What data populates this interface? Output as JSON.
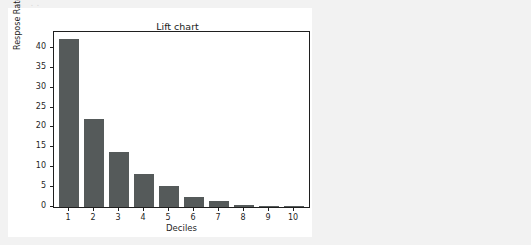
{
  "page": {
    "background_color": "#f2f2f2",
    "top_artifact_text": "..  .."
  },
  "card": {
    "background_color": "#ffffff"
  },
  "chart_data": {
    "type": "bar",
    "title": "Lift chart",
    "xlabel": "Deciles",
    "ylabel": "Respose Rate(%)",
    "categories": [
      "1",
      "2",
      "3",
      "4",
      "5",
      "6",
      "7",
      "8",
      "9",
      "10"
    ],
    "values": [
      42.2,
      22.1,
      13.8,
      8.4,
      5.2,
      2.5,
      1.5,
      0.6,
      0.2,
      0.1
    ],
    "ylim": [
      0,
      44
    ],
    "xlim": [
      0.4,
      10.6
    ],
    "yticks": [
      0,
      5,
      10,
      15,
      20,
      25,
      30,
      35,
      40
    ],
    "ytick_labels": [
      "0",
      "5",
      "10",
      "15",
      "20",
      "25",
      "30",
      "35",
      "40"
    ],
    "grid": false,
    "legend": null,
    "bar_color": "#555a5a",
    "axis_color": "#1f1f1f",
    "plot_background": "#ffffff",
    "series": [
      {
        "name": "Response Rate",
        "values": [
          42.2,
          22.1,
          13.8,
          8.4,
          5.2,
          2.5,
          1.5,
          0.6,
          0.2,
          0.1
        ]
      }
    ]
  }
}
